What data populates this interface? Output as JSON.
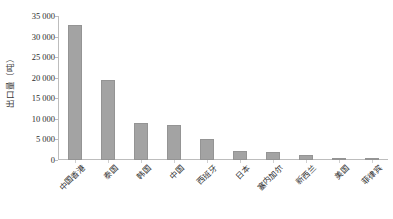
{
  "chart_data": {
    "type": "bar",
    "title": "",
    "xlabel": "",
    "ylabel": "出口量（吨）",
    "ylim": [
      0,
      35000
    ],
    "grid": false,
    "legend": "none",
    "orientation": "vertical",
    "bar_color": "#a3a3a3",
    "axis_color": "#bdbdbd",
    "categories": [
      "中国香港",
      "泰国",
      "韩国",
      "中国",
      "西班牙",
      "日本",
      "塞内加尔",
      "新西兰",
      "美国",
      "菲律宾"
    ],
    "values": [
      32700,
      19500,
      8900,
      8500,
      5200,
      2100,
      1950,
      1100,
      250,
      100
    ],
    "ytick_values": [
      0,
      5000,
      10000,
      15000,
      20000,
      25000,
      30000,
      35000
    ],
    "ytick_labels": [
      "0",
      "5 000",
      "10 000",
      "15 000",
      "20 000",
      "25 000",
      "30 000",
      "35 000"
    ]
  }
}
